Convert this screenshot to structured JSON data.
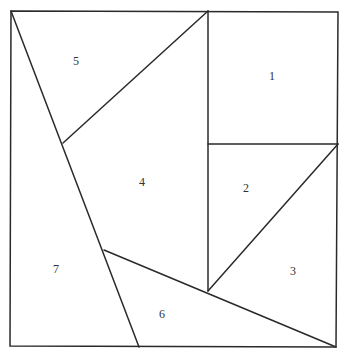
{
  "diagram": {
    "type": "tangram-square-dissection",
    "pieces": [
      {
        "id": "1",
        "label": "1",
        "x": 272,
        "y": 77
      },
      {
        "id": "2",
        "label": "2",
        "x": 246,
        "y": 189
      },
      {
        "id": "3",
        "label": "3",
        "x": 293,
        "y": 272
      },
      {
        "id": "4",
        "label": "4",
        "x": 142,
        "y": 183
      },
      {
        "id": "5",
        "label": "5",
        "x": 76,
        "y": 62
      },
      {
        "id": "6",
        "label": "6",
        "x": 162,
        "y": 315
      },
      {
        "id": "7",
        "label": "7",
        "x": 56,
        "y": 270
      }
    ],
    "colors": {
      "stroke": "#2a2a2a",
      "background": "#ffffff",
      "label": "#333333"
    }
  }
}
